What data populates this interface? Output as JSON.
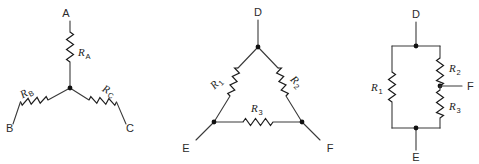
{
  "figure": {
    "background_color": "#ffffff",
    "wire_color": "#3a3a3a",
    "label_color": "#1d1d1d",
    "node_color": "#111111"
  },
  "diagrams": [
    {
      "id": "wye-network",
      "name": "Y (wye) three-terminal resistor network",
      "terminals": [
        {
          "label": "A",
          "position": "top"
        },
        {
          "label": "B",
          "position": "bottom-left"
        },
        {
          "label": "C",
          "position": "bottom-right"
        }
      ],
      "resistors": [
        {
          "label": "R",
          "subscript": "A",
          "between": [
            "A",
            "center"
          ]
        },
        {
          "label": "R",
          "subscript": "B",
          "between": [
            "B",
            "center"
          ]
        },
        {
          "label": "R",
          "subscript": "C",
          "between": [
            "C",
            "center"
          ]
        }
      ],
      "nodes": [
        "center"
      ]
    },
    {
      "id": "delta-network",
      "name": "Delta (triangle) three-terminal resistor network",
      "terminals": [
        {
          "label": "D",
          "position": "top"
        },
        {
          "label": "E",
          "position": "bottom-left"
        },
        {
          "label": "F",
          "position": "bottom-right"
        }
      ],
      "resistors": [
        {
          "label": "R",
          "subscript": "1",
          "between": [
            "D",
            "E"
          ]
        },
        {
          "label": "R",
          "subscript": "2",
          "between": [
            "D",
            "F"
          ]
        },
        {
          "label": "R",
          "subscript": "3",
          "between": [
            "E",
            "F"
          ]
        }
      ],
      "nodes": [
        "D",
        "E",
        "F"
      ]
    },
    {
      "id": "ladder-network",
      "name": "Redrawn delta network as parallel ladder",
      "terminals": [
        {
          "label": "D",
          "position": "top"
        },
        {
          "label": "E",
          "position": "bottom"
        },
        {
          "label": "F",
          "position": "right-middle"
        }
      ],
      "resistors": [
        {
          "label": "R",
          "subscript": "1",
          "between": [
            "D",
            "E"
          ]
        },
        {
          "label": "R",
          "subscript": "2",
          "between": [
            "D",
            "F"
          ]
        },
        {
          "label": "R",
          "subscript": "3",
          "between": [
            "F",
            "E"
          ]
        }
      ],
      "nodes": [
        "D",
        "E",
        "F"
      ]
    }
  ]
}
